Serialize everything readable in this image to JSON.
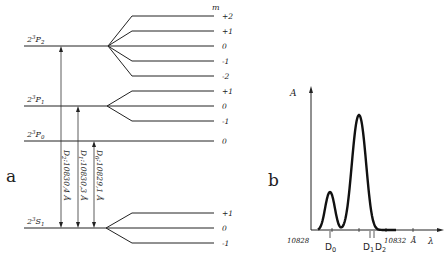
{
  "panel_a": {
    "letter": "a",
    "m_header": "m",
    "levels": [
      {
        "term_prefix": "2",
        "term_sup": "3",
        "term_main": "P",
        "term_sub": "2",
        "m_values": [
          "+2",
          "+1",
          "0",
          "-1",
          "-2"
        ]
      },
      {
        "term_prefix": "2",
        "term_sup": "3",
        "term_main": "P",
        "term_sub": "1",
        "m_values": [
          "+1",
          "0",
          "-1"
        ]
      },
      {
        "term_prefix": "2",
        "term_sup": "3",
        "term_main": "P",
        "term_sub": "0",
        "m_values": [
          "0"
        ]
      },
      {
        "term_prefix": "2",
        "term_sup": "3",
        "term_main": "S",
        "term_sub": "1",
        "m_values": [
          "+1",
          "0",
          "-1"
        ]
      }
    ],
    "transitions": [
      {
        "name": "D",
        "sub": "2",
        "label": ":10830,4 Å"
      },
      {
        "name": "D",
        "sub": "1",
        "label": ":10830,3 Å"
      },
      {
        "name": "D",
        "sub": "0",
        "label": ":10829,1 Å"
      }
    ]
  },
  "panel_b": {
    "letter": "b",
    "y_label": "A",
    "x_label": "λ",
    "x_unit": "Å",
    "x_tick_start": "10828",
    "x_tick_end": "10832",
    "markers": [
      {
        "name": "D",
        "sub": "0"
      },
      {
        "name": "D",
        "sub": "1"
      },
      {
        "name": "D",
        "sub": "2"
      }
    ]
  },
  "chart_data": {
    "type": "line",
    "title": "",
    "xlabel": "λ (Å)",
    "ylabel": "A",
    "xlim": [
      10828,
      10832.5
    ],
    "ylim": [
      0,
      1
    ],
    "x_ticks": [
      10828,
      10832
    ],
    "series": [
      {
        "name": "absorption",
        "peaks": [
          {
            "x": 10829.0,
            "height": 0.33
          },
          {
            "x": 10830.1,
            "height": 1.0
          }
        ]
      }
    ],
    "markers": [
      {
        "label": "D0",
        "x": 10829.1
      },
      {
        "label": "D1",
        "x": 10830.3
      },
      {
        "label": "D2",
        "x": 10830.4
      }
    ]
  }
}
